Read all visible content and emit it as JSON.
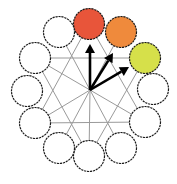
{
  "diagram": {
    "title": "",
    "center": {
      "x": 90,
      "y": 90
    },
    "node_radius": 15.5,
    "nodes": [
      {
        "id": 0,
        "x": 89,
        "y": 24,
        "fill": "#e8553a",
        "highlighted": true
      },
      {
        "id": 1,
        "x": 121,
        "y": 32,
        "fill": "#ef8a3c",
        "highlighted": true
      },
      {
        "id": 2,
        "x": 145,
        "y": 58,
        "fill": "#d6e04a",
        "highlighted": true
      },
      {
        "id": 3,
        "x": 153,
        "y": 89,
        "fill": "#ffffff",
        "highlighted": false
      },
      {
        "id": 4,
        "x": 145,
        "y": 122,
        "fill": "#ffffff",
        "highlighted": false
      },
      {
        "id": 5,
        "x": 121,
        "y": 148,
        "fill": "#ffffff",
        "highlighted": false
      },
      {
        "id": 6,
        "x": 89,
        "y": 156,
        "fill": "#ffffff",
        "highlighted": false
      },
      {
        "id": 7,
        "x": 59,
        "y": 148,
        "fill": "#ffffff",
        "highlighted": false
      },
      {
        "id": 8,
        "x": 35,
        "y": 123,
        "fill": "#ffffff",
        "highlighted": false
      },
      {
        "id": 9,
        "x": 27,
        "y": 91,
        "fill": "#ffffff",
        "highlighted": false
      },
      {
        "id": 10,
        "x": 35,
        "y": 58,
        "fill": "#ffffff",
        "highlighted": false
      },
      {
        "id": 11,
        "x": 59,
        "y": 32,
        "fill": "#ffffff",
        "highlighted": false
      }
    ],
    "chords": [
      [
        10,
        2
      ],
      [
        8,
        4
      ],
      [
        0,
        8
      ],
      [
        0,
        4
      ],
      [
        10,
        6
      ],
      [
        2,
        6
      ],
      [
        11,
        5
      ],
      [
        1,
        7
      ]
    ],
    "spokes": [
      10,
      8,
      6,
      4
    ],
    "arrows": [
      {
        "to_node": 0,
        "tip": {
          "x": 90,
          "y": 44
        }
      },
      {
        "to_node": 1,
        "tip": {
          "x": 113,
          "y": 53
        }
      },
      {
        "to_node": 2,
        "tip": {
          "x": 129,
          "y": 67
        }
      }
    ],
    "colors": {
      "line": "#9a9a9a",
      "outline": "#1a1a1a",
      "arrow": "#000000",
      "red": "#e8553a",
      "orange": "#ef8a3c",
      "yellow_green": "#d6e04a"
    }
  }
}
